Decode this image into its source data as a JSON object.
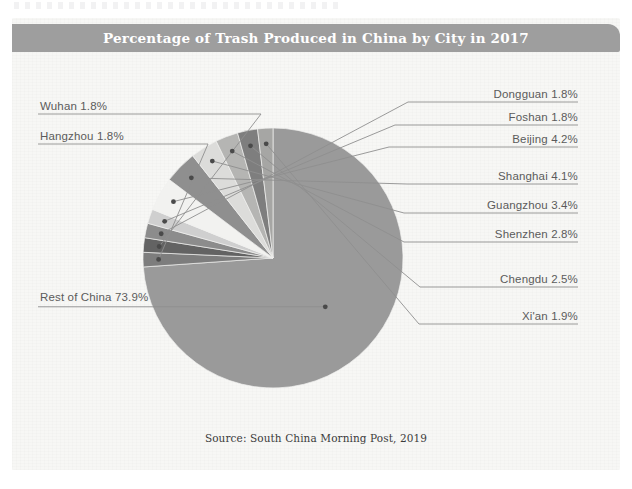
{
  "chart_data": {
    "type": "pie",
    "title": "Percentage of Trash Produced in China by City in 2017",
    "source": "Source: South China Morning Post, 2019",
    "units": "percent",
    "legend_position": "callout-labels",
    "categories": [
      "Rest of China",
      "Hangzhou",
      "Wuhan",
      "Dongguan",
      "Foshan",
      "Beijing",
      "Shanghai",
      "Guangzhou",
      "Shenzhen",
      "Chengdu",
      "Xi'an"
    ],
    "values": [
      73.9,
      1.8,
      1.8,
      1.8,
      1.8,
      4.2,
      4.1,
      3.4,
      2.8,
      2.5,
      1.9
    ],
    "slices": [
      {
        "label": "Rest of China 73.9%",
        "name": "Rest of China",
        "value": 73.9,
        "color": "#9a9a9a",
        "side": "left"
      },
      {
        "label": "Hangzhou 1.8%",
        "name": "Hangzhou",
        "value": 1.8,
        "color": "#7d7d7d",
        "side": "left"
      },
      {
        "label": "Wuhan 1.8%",
        "name": "Wuhan",
        "value": 1.8,
        "color": "#636363",
        "side": "left"
      },
      {
        "label": "Dongguan 1.8%",
        "name": "Dongguan",
        "value": 1.8,
        "color": "#8c8c8c",
        "side": "right"
      },
      {
        "label": "Foshan 1.8%",
        "name": "Foshan",
        "value": 1.8,
        "color": "#cfcfcf",
        "side": "right"
      },
      {
        "label": "Beijing 4.2%",
        "name": "Beijing",
        "value": 4.2,
        "color": "#f2f2f0",
        "side": "right"
      },
      {
        "label": "Shanghai 4.1%",
        "name": "Shanghai",
        "value": 4.1,
        "color": "#8f8f8f",
        "side": "right"
      },
      {
        "label": "Guangzhou 3.4%",
        "name": "Guangzhou",
        "value": 3.4,
        "color": "#dcdcda",
        "side": "right"
      },
      {
        "label": "Shenzhen 2.8%",
        "name": "Shenzhen",
        "value": 2.8,
        "color": "#b5b5b3",
        "side": "right"
      },
      {
        "label": "Chengdu 2.5%",
        "name": "Chengdu",
        "value": 2.5,
        "color": "#7e7e7e",
        "side": "right"
      },
      {
        "label": "Xi'an 1.9%",
        "name": "Xi'an",
        "value": 1.9,
        "color": "#a6a6a4",
        "side": "right"
      }
    ]
  },
  "colors": {
    "panel_background": "#f7f7f5",
    "title_bar": "#9e9e9e",
    "title_text": "#ffffff",
    "label_text": "#5b5b5b",
    "leader_line": "#8e8e8e",
    "source_text": "#3b3b3b"
  },
  "labels": {
    "rest_of_china": "Rest of China 73.9%",
    "hangzhou": "Hangzhou 1.8%",
    "wuhan": "Wuhan 1.8%",
    "dongguan": "Dongguan 1.8%",
    "foshan": "Foshan 1.8%",
    "beijing": "Beijing 4.2%",
    "shanghai": "Shanghai 4.1%",
    "guangzhou": "Guangzhou 3.4%",
    "shenzhen": "Shenzhen 2.8%",
    "chengdu": "Chengdu 2.5%",
    "xian": "Xi'an 1.9%"
  }
}
